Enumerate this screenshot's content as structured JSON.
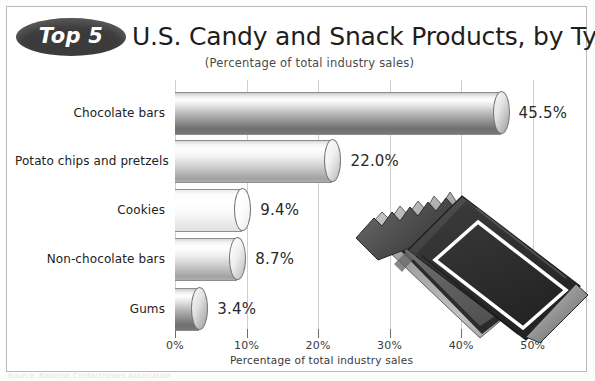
{
  "header": {
    "badge_label": "Top 5",
    "title": "U.S. Candy and Snack Products, by Type",
    "subtitle": "(Percentage of total industry sales)"
  },
  "footer": {
    "note": "Source: National Confectioners Association"
  },
  "colors": {
    "badge_fill": "#3b3b3b",
    "badge_text": "#ffffff",
    "title_text": "#1e1e1e",
    "gridline": "#cfcfcf",
    "frame_border": "#b9b9b9",
    "page_background": "#ffffff",
    "candy_wrapper": "#2f2f2f",
    "candy_foil": "#9a9a9a"
  },
  "icons": {
    "badge": "oval-badge-icon",
    "illustration": "candy-bar-illustration-icon"
  },
  "chart_data": {
    "type": "bar",
    "orientation": "horizontal",
    "title": "Top 5 U.S. Candy and Snack Products, by Type",
    "subtitle": "(Percentage of total industry sales)",
    "xlabel": "Percentage of total industry sales",
    "ylabel": "",
    "xlim": [
      0,
      55
    ],
    "grid": true,
    "legend": null,
    "xticks": [
      0,
      10,
      20,
      30,
      40,
      50
    ],
    "xticklabels": [
      "0%",
      "10%",
      "20%",
      "30%",
      "40%",
      "50%"
    ],
    "categories": [
      "Chocolate bars",
      "Potato chips and pretzels",
      "Cookies",
      "Non-chocolate bars",
      "Gums"
    ],
    "values": [
      45.5,
      22.0,
      9.4,
      8.7,
      3.4
    ],
    "datalabels": [
      "45.5%",
      "22.0%",
      "9.4%",
      "8.7%",
      "3.4%"
    ],
    "bar_styles": [
      "dark",
      "mid",
      "light",
      "mid",
      "dark"
    ]
  }
}
